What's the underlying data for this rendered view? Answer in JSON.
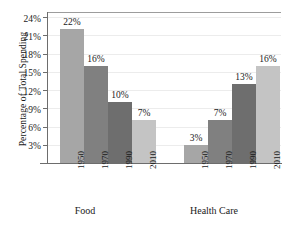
{
  "chart_data": {
    "type": "bar",
    "title": "",
    "xlabel": "",
    "ylabel": "Percentage of Total Spending",
    "ylim": [
      0,
      25
    ],
    "grid": true,
    "legend": "none",
    "categories": [
      "1950",
      "1970",
      "1990",
      "2010"
    ],
    "groups": [
      {
        "name": "Food",
        "categories": [
          "1950",
          "1970",
          "1990",
          "2010"
        ],
        "values": [
          22,
          16,
          10,
          7
        ],
        "labels": [
          "22%",
          "16%",
          "10%",
          "7%"
        ]
      },
      {
        "name": "Health Care",
        "categories": [
          "1950",
          "1970",
          "1990",
          "2010"
        ],
        "values": [
          3,
          7,
          13,
          16
        ],
        "labels": [
          "3%",
          "7%",
          "13%",
          "16%"
        ]
      }
    ],
    "yticks": [
      3,
      6,
      9,
      12,
      15,
      18,
      21,
      24
    ],
    "ytick_labels": [
      "3%",
      "6%",
      "9%",
      "12%",
      "15%",
      "18%",
      "21%",
      "24%"
    ],
    "bar_colors": [
      "#a6a6a6",
      "#808080",
      "#6e6e6e",
      "#c4c4c4"
    ],
    "colors": {
      "background": "#ffffff",
      "gridline": "#ececec",
      "axis": "#6d6d6d",
      "text": "#1a1a1a"
    }
  }
}
